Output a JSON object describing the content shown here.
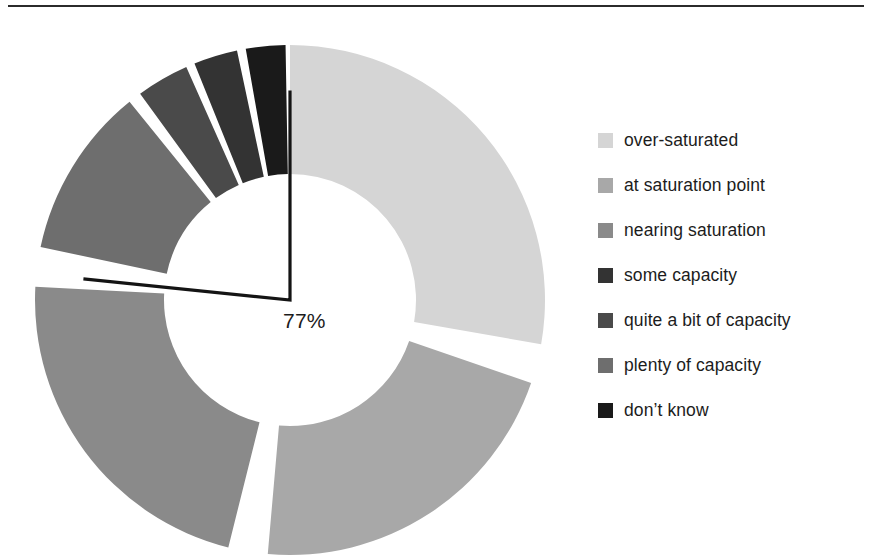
{
  "page": {
    "background": "#ffffff",
    "rule_color": "#2b2b2b"
  },
  "chart_label": {
    "value_text": "77%"
  },
  "legend": {
    "items": [
      {
        "label": "over-saturated",
        "color": "#d5d5d5"
      },
      {
        "label": "at saturation point",
        "color": "#a8a8a8"
      },
      {
        "label": "nearing saturation",
        "color": "#8a8a8a"
      },
      {
        "label": "some capacity",
        "color": "#333333"
      },
      {
        "label": "quite a bit of capacity",
        "color": "#4a4a4a"
      },
      {
        "label": "plenty of capacity",
        "color": "#6e6e6e"
      },
      {
        "label": "don’t know",
        "color": "#1a1a1a"
      }
    ]
  },
  "chart_data": {
    "type": "pie",
    "variant": "donut",
    "title": "",
    "subtitle": "",
    "xlabel": "",
    "ylabel": "",
    "grid": false,
    "legend_position": "right",
    "center": {
      "x": 290,
      "y": 300
    },
    "outer_radius": 255,
    "inner_radius": 126,
    "gap_degrees": 9,
    "start_angle_degrees": 0,
    "annotation": {
      "text": "77%",
      "kind": "angle-indicator",
      "description": "black right-angle marker from 12 o'clock reference to the 77% boundary",
      "marker_color": "#141414",
      "value_percent": 77
    },
    "categories": [
      "over-saturated",
      "at saturation point",
      "nearing saturation",
      "plenty of capacity",
      "quite a bit of capacity",
      "some capacity",
      "don’t know"
    ],
    "values": [
      28,
      21,
      22,
      11,
      4,
      4,
      3
    ],
    "unit": "%",
    "slices": [
      {
        "name": "over-saturated",
        "value": 28,
        "color": "#d5d5d5",
        "start_deg": 0,
        "end_deg": 100
      },
      {
        "name": "at saturation point",
        "value": 21,
        "color": "#a8a8a8",
        "start_deg": 109,
        "end_deg": 185
      },
      {
        "name": "nearing saturation",
        "value": 22,
        "color": "#8a8a8a",
        "start_deg": 194,
        "end_deg": 273
      },
      {
        "name": "plenty of capacity",
        "value": 11,
        "color": "#6e6e6e",
        "start_deg": 282,
        "end_deg": 321
      },
      {
        "name": "quite a bit of capacity",
        "value": 4,
        "color": "#4a4a4a",
        "start_deg": 324,
        "end_deg": 336
      },
      {
        "name": "some capacity",
        "value": 4,
        "color": "#333333",
        "start_deg": 338,
        "end_deg": 348
      },
      {
        "name": "don’t know",
        "value": 3,
        "color": "#1a1a1a",
        "start_deg": 350,
        "end_deg": 359
      }
    ]
  }
}
